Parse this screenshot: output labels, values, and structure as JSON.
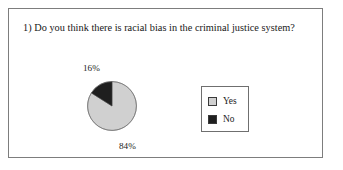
{
  "figure": {
    "title": "1) Do you think there is racial bias in the criminal justice system?",
    "frame_border_color": "#7d7d7d"
  },
  "legend": {
    "items": [
      {
        "label": "Yes",
        "swatch_color": "#d0d0d0",
        "swatch_name": "legend-swatch-yes"
      },
      {
        "label": "No",
        "swatch_color": "#1f1f1f",
        "swatch_name": "legend-swatch-no"
      }
    ]
  },
  "labels": {
    "yes": "84%",
    "no": "16%"
  },
  "chart_data": {
    "type": "pie",
    "title": "1) Do you think there is racial bias in the criminal justice system?",
    "categories": [
      "Yes",
      "No"
    ],
    "values": [
      84,
      16
    ],
    "value_labels": [
      "84%",
      "16%"
    ],
    "colors": [
      "#d0d0d0",
      "#1f1f1f"
    ],
    "units": "percent",
    "start_angle_deg": 90,
    "direction": "counterclockwise",
    "legend": true,
    "legend_position": "right",
    "grid": false,
    "xlabel": "",
    "ylabel": ""
  }
}
